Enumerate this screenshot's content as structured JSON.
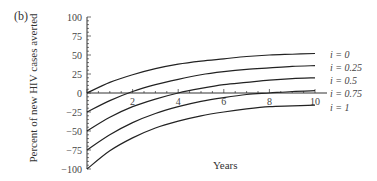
{
  "panel_label": "(b)",
  "chart_data": {
    "type": "line",
    "title": "",
    "xlabel": "Years",
    "ylabel": "Percent of new HIV cases averted",
    "xlim": [
      0,
      10
    ],
    "ylim": [
      -100,
      100
    ],
    "x_ticks": [
      2,
      4,
      6,
      8,
      10
    ],
    "y_ticks": [
      100,
      75,
      50,
      25,
      0,
      -25,
      -50,
      -75,
      -100
    ],
    "grid": false,
    "legend_position": "inline-right",
    "x": [
      0,
      1,
      2,
      3,
      4,
      5,
      6,
      7,
      8,
      9,
      10
    ],
    "series": [
      {
        "name": "i = 0",
        "values": [
          0,
          14,
          24,
          32,
          38,
          42,
          45,
          48,
          50,
          51,
          52
        ]
      },
      {
        "name": "i = 0.25",
        "values": [
          -25,
          -10,
          2,
          11,
          18,
          24,
          28,
          31,
          33,
          35,
          36
        ]
      },
      {
        "name": "i = 0.5",
        "values": [
          -50,
          -32,
          -18,
          -8,
          0,
          6,
          11,
          14,
          17,
          19,
          20
        ]
      },
      {
        "name": "i = 0.75",
        "values": [
          -75,
          -55,
          -39,
          -27,
          -18,
          -11,
          -6,
          -2,
          0,
          2,
          3
        ]
      },
      {
        "name": "i = 1",
        "values": [
          -100,
          -76,
          -59,
          -46,
          -37,
          -30,
          -25,
          -21,
          -18,
          -17,
          -16
        ]
      }
    ]
  }
}
